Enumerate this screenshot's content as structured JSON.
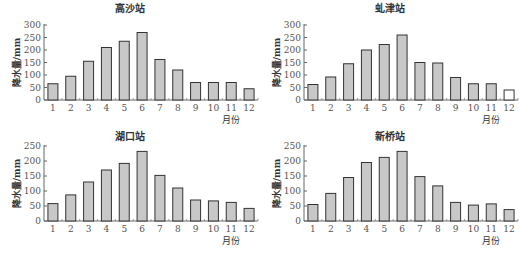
{
  "chart_data": [
    {
      "type": "bar",
      "title": "高沙站",
      "categories": [
        "1",
        "2",
        "3",
        "4",
        "5",
        "6",
        "7",
        "8",
        "9",
        "10",
        "11",
        "12"
      ],
      "values": [
        65,
        95,
        155,
        210,
        235,
        270,
        162,
        120,
        70,
        70,
        70,
        45
      ],
      "xlabel": "月份",
      "ylabel": "降水量/mm",
      "ylim": [
        0,
        300
      ],
      "yticks": [
        0,
        50,
        100,
        150,
        200,
        250,
        300
      ],
      "bar_fill": "#c8c8c8",
      "highlight_fill": null,
      "highlight_index": null
    },
    {
      "type": "bar",
      "title": "虬津站",
      "categories": [
        "1",
        "2",
        "3",
        "4",
        "5",
        "6",
        "7",
        "8",
        "9",
        "10",
        "11",
        "12"
      ],
      "values": [
        62,
        92,
        145,
        200,
        222,
        260,
        150,
        148,
        90,
        65,
        65,
        40
      ],
      "xlabel": "月份",
      "ylabel": "降水量/mm",
      "ylim": [
        0,
        300
      ],
      "yticks": [
        0,
        50,
        100,
        150,
        200,
        250,
        300
      ],
      "bar_fill": "#c8c8c8",
      "highlight_fill": "#ffffff",
      "highlight_index": 11
    },
    {
      "type": "bar",
      "title": "湖口站",
      "categories": [
        "1",
        "2",
        "3",
        "4",
        "5",
        "6",
        "7",
        "8",
        "9",
        "10",
        "11",
        "12"
      ],
      "values": [
        58,
        87,
        130,
        170,
        192,
        232,
        152,
        110,
        70,
        67,
        62,
        42
      ],
      "xlabel": "月份",
      "ylabel": "降水量/mm",
      "ylim": [
        0,
        250
      ],
      "yticks": [
        0,
        50,
        100,
        150,
        200,
        250
      ],
      "bar_fill": "#c8c8c8",
      "highlight_fill": null,
      "highlight_index": null
    },
    {
      "type": "bar",
      "title": "新桥站",
      "categories": [
        "1",
        "2",
        "3",
        "4",
        "5",
        "6",
        "7",
        "8",
        "9",
        "10",
        "11",
        "12"
      ],
      "values": [
        55,
        92,
        145,
        195,
        212,
        232,
        148,
        117,
        62,
        53,
        57,
        38
      ],
      "xlabel": "月份",
      "ylabel": "降水量/mm",
      "ylim": [
        0,
        250
      ],
      "yticks": [
        0,
        50,
        100,
        150,
        200,
        250
      ],
      "bar_fill": "#c8c8c8",
      "highlight_fill": null,
      "highlight_index": null
    }
  ]
}
